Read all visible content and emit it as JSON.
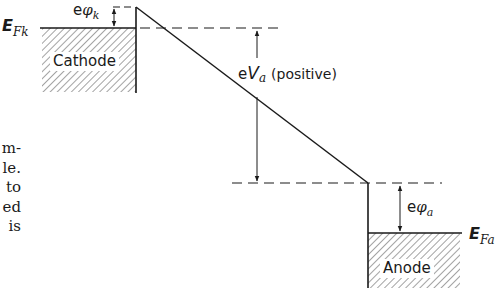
{
  "figure": {
    "labels": {
      "cathode": "Cathode",
      "anode": "Anode",
      "fermi_cathode": {
        "main": "E",
        "sub": "Fk"
      },
      "fermi_anode": {
        "main": "E",
        "sub": "Fa"
      },
      "work_function_cathode": {
        "prefix": "e",
        "symbol": "φ",
        "sub": "k"
      },
      "work_function_anode": {
        "prefix": "e",
        "symbol": "φ",
        "sub": "a"
      },
      "anode_voltage": {
        "prefix": "e",
        "symbol": "V",
        "sub": "a",
        "note": "(positive)"
      }
    },
    "colors": {
      "line": "#1a1a1a",
      "hatch": "#555555",
      "background": "#ffffff"
    }
  },
  "body_text_fragments": [
    "m-",
    "le.",
    "to",
    "ed",
    "is"
  ]
}
